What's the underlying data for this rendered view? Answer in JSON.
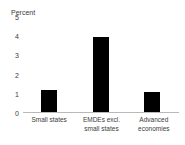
{
  "chart_data": {
    "type": "bar",
    "title": "Percent",
    "xlabel": "",
    "ylabel": "Percent",
    "categories": [
      "Small states",
      "EMDEs excl. small states",
      "Advanced economies"
    ],
    "category_lines": [
      [
        "Small states"
      ],
      [
        "EMDEs excl.",
        "small states"
      ],
      [
        "Advanced",
        "economies"
      ]
    ],
    "values": [
      1.2,
      3.95,
      1.1
    ],
    "ylim": [
      0,
      5
    ],
    "yticks": [
      5,
      4,
      3,
      2,
      1,
      0
    ],
    "ytick_labels": [
      "5",
      "4",
      "3",
      "2",
      "1",
      "0"
    ],
    "grid": false,
    "legend": false,
    "bar_color": "#000000",
    "axis_color": "#b9b9b9",
    "text_color": "#3b3b3b"
  }
}
